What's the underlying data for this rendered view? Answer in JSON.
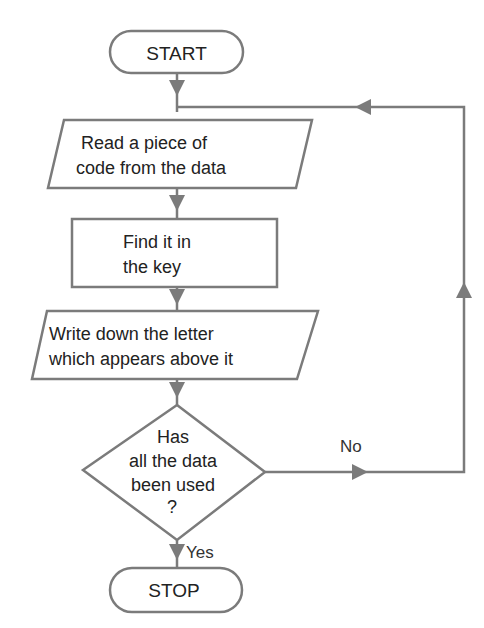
{
  "flowchart": {
    "colors": {
      "line": "#7b7b7b",
      "arrow": "#7b7b7b",
      "text": "#222222",
      "background": "#ffffff"
    },
    "nodes": {
      "start": {
        "type": "terminal",
        "label": "START"
      },
      "read": {
        "type": "input-output",
        "lines": [
          "Read a piece of",
          "code from the data"
        ]
      },
      "find": {
        "type": "process",
        "lines": [
          "Find it in",
          "the key"
        ]
      },
      "write": {
        "type": "input-output",
        "lines": [
          "Write down the letter",
          "which appears above it"
        ]
      },
      "decision": {
        "type": "decision",
        "lines": [
          "Has",
          "all the data",
          "been used",
          "?"
        ]
      },
      "stop": {
        "type": "terminal",
        "label": "STOP"
      }
    },
    "edges": [
      {
        "from": "start",
        "to": "read",
        "label": ""
      },
      {
        "from": "read",
        "to": "find",
        "label": ""
      },
      {
        "from": "find",
        "to": "write",
        "label": ""
      },
      {
        "from": "write",
        "to": "decision",
        "label": ""
      },
      {
        "from": "decision",
        "to": "stop",
        "label": "Yes"
      },
      {
        "from": "decision",
        "to": "read",
        "label": "No"
      }
    ],
    "edge_labels": {
      "yes": "Yes",
      "no": "No"
    }
  }
}
